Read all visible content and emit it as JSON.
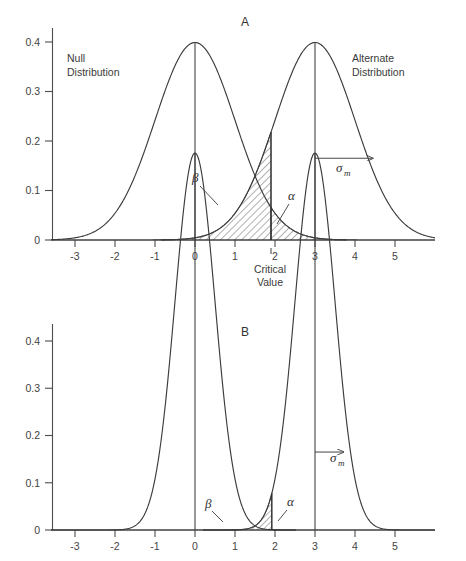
{
  "chart_data": [
    {
      "type": "line",
      "title": "A",
      "xlabel": "Critical Value",
      "ylabel": "",
      "xlim": [
        -3.6,
        6.0
      ],
      "ylim": [
        0,
        0.42
      ],
      "grid": false,
      "legend": "none",
      "xticks": [
        "-3",
        "-2",
        "-1",
        "0",
        "1",
        "2",
        "3",
        "4",
        "5"
      ],
      "xtick_values": [
        -3,
        -2,
        -1,
        0,
        1,
        2,
        3,
        4,
        5
      ],
      "yticks": [
        "0",
        "0.1",
        "0.2",
        "0.3",
        "0.4"
      ],
      "ytick_values": [
        0,
        0.1,
        0.2,
        0.3,
        0.4
      ],
      "series": [
        {
          "name": "Null Distribution",
          "distribution": "normal",
          "mean": 0,
          "sigma": 1.0,
          "peak": 0.3989
        },
        {
          "name": "Alternate Distribution",
          "distribution": "normal",
          "mean": 3,
          "sigma": 1.0,
          "peak": 0.3989
        }
      ],
      "annotations": {
        "critical_value": 1.9,
        "critical_value_label": "Critical\nValue",
        "null_label": "Null\nDistribution",
        "alternate_label": "Alternate\nDistribution",
        "beta_label": "β",
        "alpha_label": "α",
        "sigma_label": "σ",
        "sigma_subscript": "m",
        "sigma_arrow_from": 3,
        "sigma_arrow_to": 4.45,
        "sigma_arrow_y": 0.165
      }
    },
    {
      "type": "line",
      "title": "B",
      "xlabel": "",
      "ylabel": "",
      "xlim": [
        -3.6,
        6.0
      ],
      "ylim": [
        0,
        0.42
      ],
      "grid": false,
      "legend": "none",
      "xticks": [
        "-3",
        "-2",
        "-1",
        "0",
        "1",
        "2",
        "3",
        "4",
        "5"
      ],
      "xtick_values": [
        -3,
        -2,
        -1,
        0,
        1,
        2,
        3,
        4,
        5
      ],
      "yticks": [
        "0",
        "0.1",
        "0.2",
        "0.3",
        "0.4"
      ],
      "ytick_values": [
        0,
        0.1,
        0.2,
        0.3,
        0.4
      ],
      "series": [
        {
          "name": "Null Distribution",
          "distribution": "normal",
          "mean": 0,
          "sigma": 0.5,
          "peak": 0.3989
        },
        {
          "name": "Alternate Distribution",
          "distribution": "normal",
          "mean": 3,
          "sigma": 0.5,
          "peak": 0.3989
        }
      ],
      "annotations": {
        "critical_value": 1.92,
        "beta_label": "β",
        "alpha_label": "α",
        "sigma_label": "σ",
        "sigma_subscript": "m",
        "sigma_arrow_from": 3,
        "sigma_arrow_to": 3.72,
        "sigma_arrow_y": 0.165
      }
    }
  ],
  "panels": {
    "a": {
      "title": "A",
      "null_label_line1": "Null",
      "null_label_line2": "Distribution",
      "alt_label_line1": "Alternate",
      "alt_label_line2": "Distribution",
      "beta": "β",
      "alpha": "α",
      "sigma": "σ",
      "sigma_sub": "m",
      "crit_line1": "Critical",
      "crit_line2": "Value",
      "yticks": [
        "0.4",
        "0.3",
        "0.2",
        "0.1",
        "0"
      ],
      "xticks": [
        "-3",
        "-2",
        "-1",
        "0",
        "1",
        "2",
        "3",
        "4",
        "5"
      ]
    },
    "b": {
      "title": "B",
      "beta": "β",
      "alpha": "α",
      "sigma": "σ",
      "sigma_sub": "m",
      "yticks": [
        "0.4",
        "0.3",
        "0.2",
        "0.1",
        "0"
      ],
      "xticks": [
        "-3",
        "-2",
        "-1",
        "0",
        "1",
        "2",
        "3",
        "4",
        "5"
      ]
    }
  },
  "colors": {
    "background": "#ffffff",
    "axis": "#4d4d4d",
    "curve": "#3c3c3c",
    "text": "#3a3a3a",
    "hatch": "#2e2e2e"
  }
}
